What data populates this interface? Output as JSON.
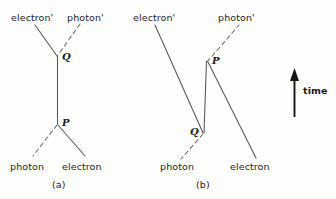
{
  "figure": {
    "background_color": "#fdfdfc",
    "line_color": "#55555a",
    "arrow_color": "#161616",
    "text_color": "#1d1d1d"
  },
  "time_axis": {
    "label": "time",
    "direction": "upward",
    "arrow_icon": "up-arrow-icon"
  },
  "diagrams": [
    {
      "caption": "(a)",
      "vertices": [
        {
          "name": "Q",
          "label": "Q",
          "role": "upper-vertex"
        },
        {
          "name": "P",
          "label": "P",
          "role": "lower-vertex"
        }
      ],
      "legs": [
        {
          "name": "electron-out",
          "label": "electron'",
          "style": "solid",
          "position": "top-left"
        },
        {
          "name": "photon-out",
          "label": "photon'",
          "style": "dashed",
          "position": "top-right"
        },
        {
          "name": "photon-in",
          "label": "photon",
          "style": "dashed",
          "position": "bottom-left"
        },
        {
          "name": "electron-in",
          "label": "electron",
          "style": "solid",
          "position": "bottom-right"
        }
      ],
      "internal_line": {
        "name": "electron-propagator",
        "style": "solid",
        "from": "P",
        "to": "Q"
      }
    },
    {
      "caption": "(b)",
      "vertices": [
        {
          "name": "P",
          "label": "P",
          "role": "upper-vertex"
        },
        {
          "name": "Q",
          "label": "Q",
          "role": "lower-vertex"
        }
      ],
      "legs": [
        {
          "name": "electron-out",
          "label": "electron'",
          "style": "solid",
          "position": "top-left"
        },
        {
          "name": "photon-out",
          "label": "photon'",
          "style": "dashed",
          "position": "top-right"
        },
        {
          "name": "photon-in",
          "label": "photon",
          "style": "dashed",
          "position": "bottom-left"
        },
        {
          "name": "electron-in",
          "label": "electron",
          "style": "solid",
          "position": "bottom-right"
        }
      ],
      "internal_line": {
        "name": "electron-propagator",
        "style": "solid",
        "from": "Q",
        "to": "P"
      }
    }
  ]
}
